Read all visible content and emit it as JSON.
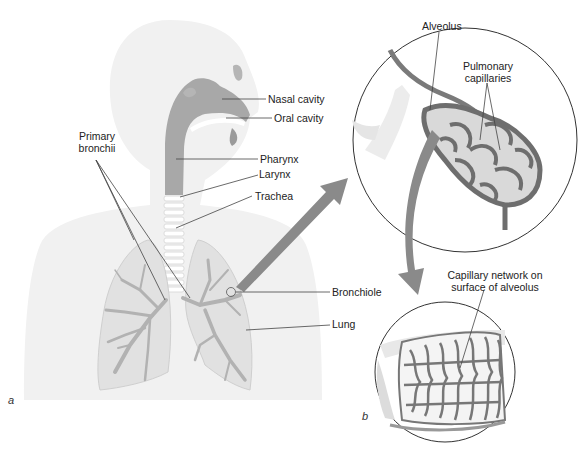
{
  "figure": {
    "panel_a": {
      "letter": "a",
      "labels": {
        "nasal_cavity": "Nasal cavity",
        "oral_cavity": "Oral cavity",
        "pharynx": "Pharynx",
        "larynx": "Larynx",
        "trachea": "Trachea",
        "primary_bronchii_1": "Primary",
        "primary_bronchii_2": "bronchii",
        "bronchiole": "Bronchiole",
        "lung": "Lung"
      }
    },
    "panel_b": {
      "letter": "b",
      "labels": {
        "alveolus": "Alveolus",
        "pulmonary_capillaries_1": "Pulmonary",
        "pulmonary_capillaries_2": "capillaries",
        "capillary_network_1": "Capillary network on",
        "capillary_network_2": "surface of alveolus"
      }
    },
    "colors": {
      "silhouette": "#f0f0f0",
      "airway": "#a9a9a9",
      "lung_fill": "#e2e2e2",
      "bronchi": "#b4b4b4",
      "capillary": "#6e6e6e",
      "arrow": "#8a8a8a",
      "leader_line": "#444444"
    }
  }
}
